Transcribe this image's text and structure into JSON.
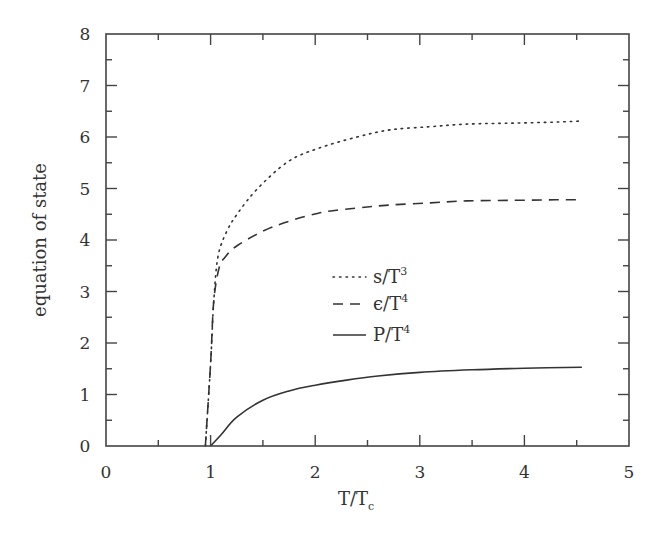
{
  "chart_data": {
    "type": "line",
    "title": "",
    "xlabel": "T/T_c",
    "xlabel_main": "T/T",
    "xlabel_sub": "c",
    "ylabel": "equation of state",
    "xlim": [
      0,
      5
    ],
    "ylim": [
      0,
      8
    ],
    "xticks": [
      0,
      1,
      2,
      3,
      4,
      5
    ],
    "xticks_minor": [
      0.5,
      1.5,
      2.5,
      3.5,
      4.5
    ],
    "yticks": [
      0,
      1,
      2,
      3,
      4,
      5,
      6,
      7,
      8
    ],
    "yticks_minor": [
      0.5,
      1.5,
      2.5,
      3.5,
      4.5,
      5.5,
      6.5,
      7.5
    ],
    "grid": false,
    "legend_position": "center",
    "series": [
      {
        "name": "s/T^3",
        "label_main": "s/T",
        "label_sup": "3",
        "style": "dotted",
        "x": [
          0.95,
          1.0,
          1.03,
          1.07,
          1.15,
          1.26,
          1.45,
          1.74,
          2.03,
          2.4,
          2.72,
          3.1,
          3.45,
          3.9,
          4.3,
          4.55
        ],
        "y": [
          0.0,
          1.6,
          2.8,
          3.67,
          4.15,
          4.52,
          5.0,
          5.52,
          5.78,
          6.0,
          6.14,
          6.2,
          6.25,
          6.27,
          6.29,
          6.31
        ]
      },
      {
        "name": "ε/T^4",
        "label_main": "ϵ/T",
        "label_sup": "4",
        "style": "dashed",
        "x": [
          0.95,
          1.0,
          1.03,
          1.08,
          1.14,
          1.26,
          1.59,
          2.03,
          2.4,
          2.72,
          3.1,
          3.45,
          3.9,
          4.3,
          4.55
        ],
        "y": [
          0.0,
          1.6,
          2.8,
          3.45,
          3.67,
          3.9,
          4.25,
          4.52,
          4.62,
          4.68,
          4.72,
          4.76,
          4.77,
          4.78,
          4.78
        ]
      },
      {
        "name": "P/T^4",
        "label_main": "P/T",
        "label_sup": "4",
        "style": "solid",
        "x": [
          1.0,
          1.1,
          1.25,
          1.5,
          1.75,
          2.0,
          2.3,
          2.6,
          3.0,
          3.5,
          4.0,
          4.55
        ],
        "y": [
          0.0,
          0.22,
          0.56,
          0.89,
          1.07,
          1.18,
          1.28,
          1.36,
          1.43,
          1.48,
          1.51,
          1.53
        ]
      }
    ]
  },
  "colors": {
    "line": "#333333",
    "axis": "#444444",
    "background": "#ffffff"
  }
}
